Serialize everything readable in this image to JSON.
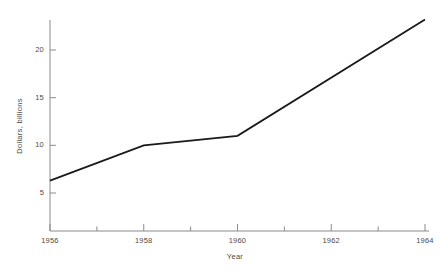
{
  "chart_data": {
    "type": "line",
    "title": "",
    "subtitle": "",
    "xlabel": "Year",
    "ylabel": "Dollars, billions",
    "xlim": [
      1956,
      1964
    ],
    "ylim": [
      0,
      24.3
    ],
    "grid": false,
    "legend": false,
    "legend_position": "none",
    "x_major_ticks": [
      1956,
      1958,
      1960,
      1962,
      1964
    ],
    "x_major_tick_labels": [
      "1956",
      "1958",
      "1960",
      "1962",
      "1964"
    ],
    "x_minor_ticks": [
      1957,
      1959,
      1961,
      1963
    ],
    "y_major_ticks": [
      5,
      10,
      15,
      20
    ],
    "y_major_tick_labels": [
      "5",
      "10",
      "15",
      "20"
    ],
    "line_color": "#1a1a1a",
    "axis_color": "#8a8a8a",
    "series": [
      {
        "name": "Dollars, billions",
        "x": [
          1956,
          1958,
          1960,
          1964
        ],
        "values": [
          6.3,
          10.0,
          11.0,
          23.2
        ]
      }
    ],
    "annotations": []
  },
  "axes": {
    "x_title": "Year",
    "y_title": "Dollars, billions"
  },
  "ticks": {
    "x": [
      {
        "label": "1956",
        "value": 1956
      },
      {
        "label": "1958",
        "value": 1958
      },
      {
        "label": "1960",
        "value": 1960
      },
      {
        "label": "1962",
        "value": 1962
      },
      {
        "label": "1964",
        "value": 1964
      }
    ],
    "y": [
      {
        "label": "20",
        "value": 20
      },
      {
        "label": "15",
        "value": 15
      },
      {
        "label": "10",
        "value": 10
      },
      {
        "label": "5",
        "value": 5
      }
    ]
  }
}
